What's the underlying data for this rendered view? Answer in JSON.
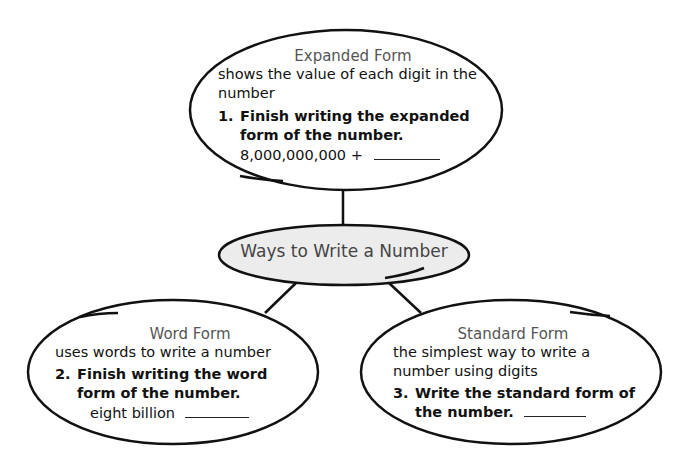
{
  "diagram": {
    "title": "Ways to Write a Number",
    "colors": {
      "outline": "#111111",
      "center_fill": "#ececec",
      "heading_text": "#555555",
      "body_text": "#111111",
      "background": "#ffffff"
    },
    "nodes": {
      "expanded": {
        "heading": "Expanded Form",
        "description": "shows the value of each digit in the number",
        "task_number": "1.",
        "task_text": "Finish writing the expanded form of the number.",
        "given_value": "8,000,000,000 +"
      },
      "word": {
        "heading": "Word Form",
        "description": "uses words to write a number",
        "task_number": "2.",
        "task_text": "Finish writing the word form of the number.",
        "given_value": "eight billion"
      },
      "standard": {
        "heading": "Standard Form",
        "description": "the simplest way to write a number using digits",
        "task_number": "3.",
        "task_text": "Write the standard form of the number."
      }
    },
    "edges": [
      {
        "from": "Ways to Write a Number",
        "to": "Expanded Form"
      },
      {
        "from": "Ways to Write a Number",
        "to": "Word Form"
      },
      {
        "from": "Ways to Write a Number",
        "to": "Standard Form"
      }
    ]
  }
}
